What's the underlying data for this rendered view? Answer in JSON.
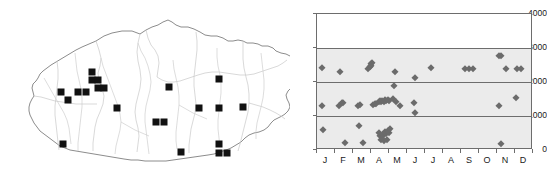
{
  "figure": {
    "panels": [
      "distribution-map",
      "elevation-phenology-scatter"
    ]
  },
  "map": {
    "title": "",
    "region_name": "Bhutan",
    "outline_color": "#6f6f6f",
    "river_color": "#cfcfcf",
    "district_color": "#c9c9c9",
    "point_color": "#111111",
    "point_symbol": "filled-square",
    "point_count": 22,
    "points": [
      {
        "x": 92,
        "y": 72
      },
      {
        "x": 92,
        "y": 80
      },
      {
        "x": 98,
        "y": 80
      },
      {
        "x": 98,
        "y": 88
      },
      {
        "x": 61,
        "y": 92
      },
      {
        "x": 78,
        "y": 92
      },
      {
        "x": 68,
        "y": 100
      },
      {
        "x": 117,
        "y": 108
      },
      {
        "x": 169,
        "y": 87
      },
      {
        "x": 219,
        "y": 79
      },
      {
        "x": 199,
        "y": 108
      },
      {
        "x": 219,
        "y": 108
      },
      {
        "x": 156,
        "y": 122
      },
      {
        "x": 164,
        "y": 122
      },
      {
        "x": 63,
        "y": 144
      },
      {
        "x": 181,
        "y": 152
      },
      {
        "x": 219,
        "y": 144
      },
      {
        "x": 219,
        "y": 153
      },
      {
        "x": 227,
        "y": 153
      },
      {
        "x": 243,
        "y": 107
      },
      {
        "x": 104,
        "y": 88
      },
      {
        "x": 86,
        "y": 92
      }
    ]
  },
  "chart_data": {
    "type": "scatter",
    "title": "",
    "xlabel": "",
    "ylabel": "",
    "xlim": [
      0,
      12
    ],
    "ylim": [
      0,
      4000
    ],
    "ytick_values": [
      0,
      1000,
      2000,
      3000,
      4000
    ],
    "ytick_labels": [
      "0",
      "1000",
      "2000",
      "3000",
      "4000"
    ],
    "categories": [
      "J",
      "F",
      "M",
      "A",
      "M",
      "J",
      "J",
      "A",
      "S",
      "O",
      "N",
      "D"
    ],
    "xtick_labels": [
      "J",
      "F",
      "M",
      "A",
      "M",
      "J",
      "J",
      "A",
      "S",
      "O",
      "N",
      "D"
    ],
    "grid": true,
    "gridlines_y": [
      1000,
      2000,
      3000
    ],
    "legend": null,
    "marker": "diamond",
    "marker_color": "#6b6b6b",
    "shaded_band": {
      "from": 0,
      "to": 3000,
      "color": "#ebebeb"
    },
    "points": [
      {
        "month": "J",
        "x": 0.3,
        "y": 2400
      },
      {
        "month": "J",
        "x": 0.28,
        "y": 1300
      },
      {
        "month": "J",
        "x": 0.32,
        "y": 600
      },
      {
        "month": "F",
        "x": 1.3,
        "y": 2300
      },
      {
        "month": "F",
        "x": 1.22,
        "y": 1300
      },
      {
        "month": "F",
        "x": 1.4,
        "y": 1370
      },
      {
        "month": "F",
        "x": 1.46,
        "y": 1380
      },
      {
        "month": "F",
        "x": 1.55,
        "y": 200
      },
      {
        "month": "M",
        "x": 2.3,
        "y": 1300
      },
      {
        "month": "M",
        "x": 2.4,
        "y": 1320
      },
      {
        "month": "M",
        "x": 2.35,
        "y": 700
      },
      {
        "month": "M",
        "x": 2.55,
        "y": 200
      },
      {
        "month": "M",
        "x": 2.85,
        "y": 2380
      },
      {
        "month": "M",
        "x": 2.92,
        "y": 2430
      },
      {
        "month": "M",
        "x": 2.98,
        "y": 2470
      },
      {
        "month": "M",
        "x": 3.02,
        "y": 2520
      },
      {
        "month": "M",
        "x": 3.08,
        "y": 2560
      },
      {
        "month": "A",
        "x": 3.1,
        "y": 1320
      },
      {
        "month": "A",
        "x": 3.2,
        "y": 1340
      },
      {
        "month": "A",
        "x": 3.3,
        "y": 1360
      },
      {
        "month": "A",
        "x": 3.42,
        "y": 1420
      },
      {
        "month": "A",
        "x": 3.48,
        "y": 1450
      },
      {
        "month": "A",
        "x": 3.55,
        "y": 1400
      },
      {
        "month": "A",
        "x": 3.62,
        "y": 1440
      },
      {
        "month": "A",
        "x": 3.7,
        "y": 1420
      },
      {
        "month": "A",
        "x": 3.78,
        "y": 1460
      },
      {
        "month": "A",
        "x": 3.86,
        "y": 1430
      },
      {
        "month": "A",
        "x": 3.94,
        "y": 1480
      },
      {
        "month": "A",
        "x": 4.02,
        "y": 1450
      },
      {
        "month": "A",
        "x": 3.45,
        "y": 500
      },
      {
        "month": "A",
        "x": 3.52,
        "y": 420
      },
      {
        "month": "A",
        "x": 3.6,
        "y": 380
      },
      {
        "month": "A",
        "x": 3.68,
        "y": 450
      },
      {
        "month": "A",
        "x": 3.76,
        "y": 520
      },
      {
        "month": "A",
        "x": 3.84,
        "y": 480
      },
      {
        "month": "A",
        "x": 3.92,
        "y": 560
      },
      {
        "month": "A",
        "x": 4.0,
        "y": 500
      },
      {
        "month": "A",
        "x": 4.08,
        "y": 620
      },
      {
        "month": "A",
        "x": 3.56,
        "y": 300
      },
      {
        "month": "A",
        "x": 3.7,
        "y": 260
      },
      {
        "month": "A",
        "x": 3.88,
        "y": 300
      },
      {
        "month": "M",
        "x": 4.32,
        "y": 2300
      },
      {
        "month": "M",
        "x": 4.3,
        "y": 1880
      },
      {
        "month": "M",
        "x": 4.22,
        "y": 1500
      },
      {
        "month": "M",
        "x": 4.4,
        "y": 1420
      },
      {
        "month": "M",
        "x": 4.6,
        "y": 1300
      },
      {
        "month": "J",
        "x": 5.42,
        "y": 2120
      },
      {
        "month": "J",
        "x": 5.4,
        "y": 1370
      },
      {
        "month": "J",
        "x": 5.46,
        "y": 1080
      },
      {
        "month": "J",
        "x": 6.35,
        "y": 2400
      },
      {
        "month": "S",
        "x": 8.22,
        "y": 2380
      },
      {
        "month": "S",
        "x": 8.45,
        "y": 2380
      },
      {
        "month": "S",
        "x": 8.68,
        "y": 2380
      },
      {
        "month": "N",
        "x": 10.1,
        "y": 2760
      },
      {
        "month": "N",
        "x": 10.22,
        "y": 2760
      },
      {
        "month": "N",
        "x": 10.5,
        "y": 2380
      },
      {
        "month": "N",
        "x": 10.12,
        "y": 1300
      },
      {
        "month": "N",
        "x": 10.22,
        "y": 180
      },
      {
        "month": "D",
        "x": 11.1,
        "y": 2380
      },
      {
        "month": "D",
        "x": 11.32,
        "y": 2380
      },
      {
        "month": "D",
        "x": 11.06,
        "y": 1520
      }
    ]
  }
}
